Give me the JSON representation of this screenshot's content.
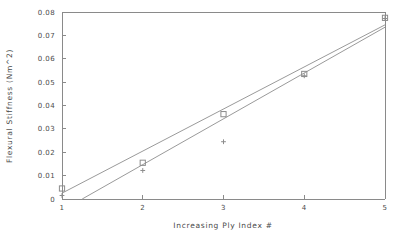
{
  "chart_data": {
    "type": "scatter",
    "title": "",
    "xlabel": "Increasing Ply Index #",
    "ylabel": "Flexural Stiffness (Nm^2)",
    "xlim": [
      1,
      5
    ],
    "ylim": [
      0,
      0.08
    ],
    "grid": false,
    "legend": "none",
    "x_ticks": [
      1,
      2,
      3,
      4,
      5
    ],
    "x_tick_labels": [
      "1",
      "2",
      "3",
      "4",
      "5"
    ],
    "y_ticks": [
      0,
      0.01,
      0.02,
      0.03,
      0.04,
      0.05,
      0.06,
      0.07,
      0.08
    ],
    "y_tick_labels": [
      "0",
      "0.01",
      "0.02",
      "0.03",
      "0.04",
      "0.05",
      "0.06",
      "0.07",
      "0.08"
    ],
    "x": [
      1,
      2,
      3,
      4,
      5
    ],
    "series": [
      {
        "name": "square-series",
        "marker": "square",
        "values": [
          0.0045,
          0.0155,
          0.0363,
          0.0535,
          0.0775
        ]
      },
      {
        "name": "plus-series",
        "marker": "plus",
        "values": [
          0.0015,
          0.0122,
          0.0245,
          0.0527,
          0.0772
        ]
      }
    ],
    "trend_lines": [
      {
        "name": "upper-fit-line",
        "x_start": 1,
        "y_start": 0.0025,
        "x_end": 5,
        "y_end": 0.0745
      },
      {
        "name": "lower-fit-line",
        "x_start": 1.25,
        "y_start": 0.0,
        "x_end": 5,
        "y_end": 0.0735
      }
    ],
    "colors": {
      "axis": "#8a8a8a",
      "line": "#9a9a9a",
      "marker": "#8c8c8c",
      "text": "#4a4a4a",
      "background": "#ffffff"
    }
  }
}
